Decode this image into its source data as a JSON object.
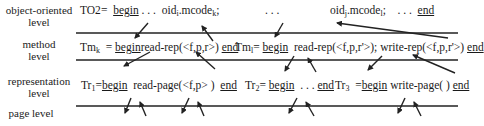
{
  "levels": [
    {
      "label_line1": "object-oriented",
      "label_line2": "level"
    },
    {
      "label_line1": "method",
      "label_line2": "level"
    },
    {
      "label_line1": "representation",
      "label_line2": "level"
    },
    {
      "label_line1": "page level",
      "label_line2": ""
    }
  ],
  "rows": {
    "oo": {
      "name": "TO2",
      "eq": "=",
      "begin": "begin",
      "dots1": ". . .",
      "call1": "oid",
      "call1_sub": "i",
      "call1_rest": ".mcode",
      "call1_sub2": "k",
      "semi1": ";",
      "dots2": ". . .",
      "call2": "oid",
      "call2_sub": "j",
      "call2_rest": ".mcode",
      "call2_sub2": "l",
      "semi2": ";",
      "dots3": ". . .",
      "end": "end"
    },
    "method_k": {
      "name": "Tm",
      "sub": "k",
      "eq": "=",
      "begin": "begin",
      "body": "read-rep(<f,p,r>)",
      "end": "end"
    },
    "method_l": {
      "name": "Tm",
      "sub": "l",
      "eq": "=",
      "begin": "begin",
      "body": "read-rep(<f,p,r'>); write-rep(<f,p,r'>)",
      "end": "end"
    },
    "rep_1": {
      "name": "Tr",
      "sub": "1",
      "eq": "=",
      "begin": "begin",
      "body": "read-page(<f,p> )",
      "end": "end"
    },
    "rep_2": {
      "name": "Tr",
      "sub": "2",
      "eq": "=",
      "begin": "begin",
      "body": ". . .",
      "end": "end"
    },
    "rep_3": {
      "name": "Tr",
      "sub": "3",
      "eq": "=",
      "begin": "begin",
      "body": "write-page( )",
      "end": "end"
    }
  },
  "colors": {
    "line": "#222222",
    "text": "#1a1a1a"
  }
}
